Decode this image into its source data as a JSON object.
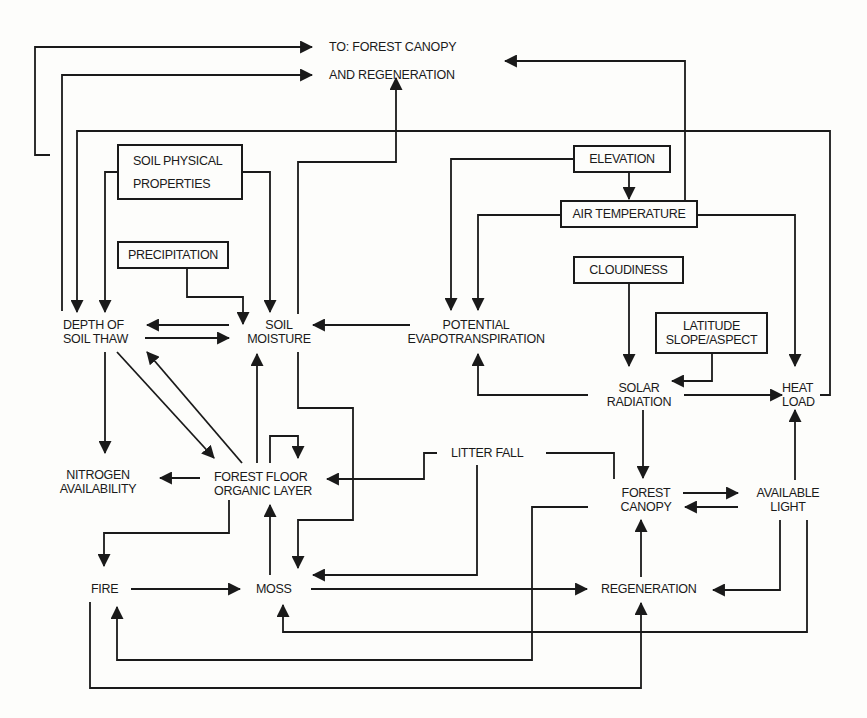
{
  "diagram": {
    "type": "flow-diagram",
    "colors": {
      "line": "#1a1a1a",
      "background": "#fdfdfb"
    },
    "header": {
      "line1": "TO:  FOREST CANOPY",
      "line2": "AND REGENERATION"
    },
    "nodes": {
      "soil_physical": {
        "line1": "SOIL PHYSICAL",
        "line2": "PROPERTIES",
        "boxed": true
      },
      "precipitation": {
        "line1": "PRECIPITATION",
        "boxed": true
      },
      "elevation": {
        "line1": "ELEVATION",
        "boxed": true
      },
      "air_temperature": {
        "line1": "AIR TEMPERATURE",
        "boxed": true
      },
      "cloudiness": {
        "line1": "CLOUDINESS",
        "boxed": true
      },
      "latitude": {
        "line1": "LATITUDE",
        "line2": "SLOPE/ASPECT",
        "boxed": true
      },
      "depth_of_soil_thaw": {
        "line1": "DEPTH OF",
        "line2": "SOIL THAW"
      },
      "soil_moisture": {
        "line1": "SOIL",
        "line2": "MOISTURE"
      },
      "potential_evapotranspiration": {
        "line1": "POTENTIAL",
        "line2": "EVAPOTRANSPIRATION"
      },
      "solar_radiation": {
        "line1": "SOLAR",
        "line2": "RADIATION"
      },
      "heat_load": {
        "line1": "HEAT",
        "line2": "LOAD"
      },
      "nitrogen_availability": {
        "line1": "NITROGEN",
        "line2": "AVAILABILITY"
      },
      "forest_floor": {
        "line1": "FOREST FLOOR",
        "line2": "ORGANIC LAYER"
      },
      "litter_fall": {
        "line1": "LITTER FALL"
      },
      "forest_canopy": {
        "line1": "FOREST",
        "line2": "CANOPY"
      },
      "available_light": {
        "line1": "AVAILABLE",
        "line2": "LIGHT"
      },
      "fire": {
        "line1": "FIRE"
      },
      "moss": {
        "line1": "MOSS"
      },
      "regeneration": {
        "line1": "REGENERATION"
      }
    },
    "edges": [
      {
        "from": "Depth of Soil Thaw",
        "to": "Forest Canopy and Regeneration (header)"
      },
      {
        "from": "Nitrogen Availability",
        "to": "Forest Canopy and Regeneration (header)"
      },
      {
        "from": "Soil Moisture",
        "to": "Forest Canopy and Regeneration (header)"
      },
      {
        "from": "Air Temperature",
        "to": "Forest Canopy and Regeneration (header)"
      },
      {
        "from": "Heat Load",
        "to": "Depth of Soil Thaw"
      },
      {
        "from": "Soil Physical Properties",
        "to": "Depth of Soil Thaw"
      },
      {
        "from": "Soil Physical Properties",
        "to": "Soil Moisture"
      },
      {
        "from": "Precipitation",
        "to": "Soil Moisture"
      },
      {
        "from": "Elevation",
        "to": "Air Temperature"
      },
      {
        "from": "Elevation",
        "to": "Potential Evapotranspiration"
      },
      {
        "from": "Air Temperature",
        "to": "Potential Evapotranspiration"
      },
      {
        "from": "Air Temperature",
        "to": "Heat Load"
      },
      {
        "from": "Cloudiness",
        "to": "Solar Radiation"
      },
      {
        "from": "Latitude Slope/Aspect",
        "to": "Solar Radiation"
      },
      {
        "from": "Solar Radiation",
        "to": "Potential Evapotranspiration"
      },
      {
        "from": "Solar Radiation",
        "to": "Heat Load"
      },
      {
        "from": "Solar Radiation",
        "to": "Forest Canopy"
      },
      {
        "from": "Potential Evapotranspiration",
        "to": "Soil Moisture"
      },
      {
        "from": "Soil Moisture",
        "to": "Depth of Soil Thaw"
      },
      {
        "from": "Depth of Soil Thaw",
        "to": "Soil Moisture"
      },
      {
        "from": "Depth of Soil Thaw",
        "to": "Nitrogen Availability"
      },
      {
        "from": "Depth of Soil Thaw",
        "to": "Forest Floor Organic Layer"
      },
      {
        "from": "Forest Floor Organic Layer",
        "to": "Depth of Soil Thaw"
      },
      {
        "from": "Forest Floor Organic Layer",
        "to": "Soil Moisture"
      },
      {
        "from": "Forest Floor Organic Layer",
        "to": "Forest Floor Organic Layer"
      },
      {
        "from": "Forest Floor Organic Layer",
        "to": "Nitrogen Availability"
      },
      {
        "from": "Soil Moisture",
        "to": "Moss"
      },
      {
        "from": "Litter Fall",
        "to": "Forest Floor Organic Layer"
      },
      {
        "from": "Litter Fall",
        "to": "Moss"
      },
      {
        "from": "Forest Canopy",
        "to": "Litter Fall"
      },
      {
        "from": "Forest Canopy",
        "to": "Available Light"
      },
      {
        "from": "Available Light",
        "to": "Forest Canopy"
      },
      {
        "from": "Available Light",
        "to": "Heat Load"
      },
      {
        "from": "Available Light",
        "to": "Regeneration"
      },
      {
        "from": "Available Light",
        "to": "Moss"
      },
      {
        "from": "Regeneration",
        "to": "Forest Canopy"
      },
      {
        "from": "Forest Floor Organic Layer",
        "to": "Fire"
      },
      {
        "from": "Fire",
        "to": "Forest Floor Organic Layer"
      },
      {
        "from": "Fire",
        "to": "Moss"
      },
      {
        "from": "Fire",
        "to": "Regeneration"
      },
      {
        "from": "Moss",
        "to": "Forest Floor Organic Layer"
      },
      {
        "from": "Moss",
        "to": "Regeneration"
      },
      {
        "from": "Forest Canopy",
        "to": "Fire"
      }
    ]
  }
}
